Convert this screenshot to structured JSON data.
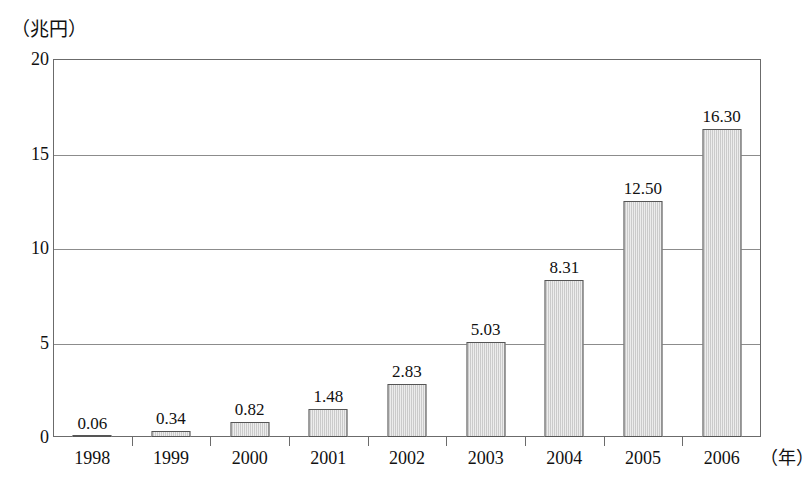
{
  "chart_data": {
    "type": "bar",
    "title": "",
    "subtitle": "",
    "xlabel": "（年）",
    "ylabel": "（兆円）",
    "categories": [
      "1998",
      "1999",
      "2000",
      "2001",
      "2002",
      "2003",
      "2004",
      "2005",
      "2006"
    ],
    "values": [
      0.06,
      0.34,
      0.82,
      1.48,
      2.83,
      5.03,
      8.31,
      12.5,
      16.3
    ],
    "value_labels": [
      "0.06",
      "0.34",
      "0.82",
      "1.48",
      "2.83",
      "5.03",
      "8.31",
      "12.50",
      "16.30"
    ],
    "ylim": [
      0,
      20
    ],
    "yticks": [
      0,
      5,
      10,
      15,
      20
    ],
    "ytick_labels": [
      "0",
      "5",
      "10",
      "15",
      "20"
    ],
    "grid": "horizontal",
    "legend": "none",
    "bar_fill_color": "#d6d6d6",
    "bar_border_color": "#555555",
    "axis_color": "#6b6b6b",
    "background_color": "#ffffff"
  }
}
